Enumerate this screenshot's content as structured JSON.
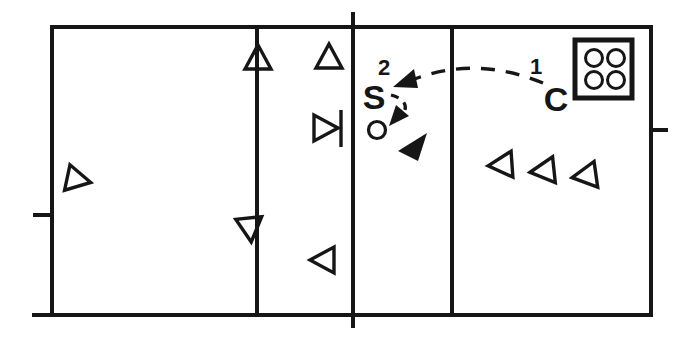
{
  "meta": {
    "background": "#ffffff",
    "ink": "#161616"
  },
  "labels": {
    "setter": "S",
    "coach": "C",
    "phase1": "1",
    "phase2": "2"
  },
  "court": {
    "outer": {
      "x": 52,
      "y": 27,
      "width": 599,
      "height": 288,
      "stroke_width": 4
    },
    "baseline_tail": {
      "name": "baseline-tail",
      "x1": 32,
      "y1": 315,
      "x2": 52,
      "y2": 315,
      "width": 4
    },
    "vertical_lines": [
      {
        "name": "left-attack-line",
        "x": 257,
        "y1": 27,
        "y2": 315,
        "width": 4
      },
      {
        "name": "center-net-line",
        "x": 353,
        "y1": 12,
        "y2": 328,
        "width": 4
      },
      {
        "name": "right-attack-line",
        "x": 452,
        "y1": 27,
        "y2": 315,
        "width": 4
      }
    ],
    "side_marks": [
      {
        "name": "left-side-mark",
        "x1": 33,
        "y1": 215,
        "x2": 52,
        "y2": 215,
        "width": 4
      },
      {
        "name": "right-side-mark",
        "x1": 651,
        "y1": 130,
        "x2": 668,
        "y2": 130,
        "width": 4
      }
    ]
  },
  "players_open": [
    {
      "name": "player-triangle-up-on-left-attack-line",
      "dir": "up",
      "x": 258,
      "y": 57,
      "rot": 0
    },
    {
      "name": "player-triangle-up-front-zone",
      "dir": "up",
      "x": 329,
      "y": 56,
      "rot": 0
    },
    {
      "name": "player-triangle-right-at-net",
      "dir": "right",
      "x": 326,
      "y": 128,
      "rot": 0,
      "bar": true
    },
    {
      "name": "player-triangle-right-left-court",
      "dir": "right",
      "x": 79,
      "y": 180,
      "rot": 12
    },
    {
      "name": "player-triangle-down-on-left-attack-line",
      "dir": "down",
      "x": 250,
      "y": 230,
      "rot": -6
    },
    {
      "name": "player-triangle-left-mid-court",
      "dir": "left",
      "x": 322,
      "y": 260,
      "rot": 0
    },
    {
      "name": "queue-player-triangle-1",
      "dir": "left",
      "x": 500,
      "y": 165,
      "rot": -4
    },
    {
      "name": "queue-player-triangle-2",
      "dir": "left",
      "x": 542,
      "y": 171,
      "rot": -6
    },
    {
      "name": "queue-player-triangle-3",
      "dir": "left",
      "x": 584,
      "y": 176,
      "rot": -8
    }
  ],
  "player_solid": {
    "name": "solid-player-triangle",
    "points": "398,151 427,133 418,161"
  },
  "ball": {
    "name": "ball-circle",
    "cx": 377,
    "cy": 130,
    "r": 8.5,
    "stroke_width": 3.2
  },
  "ball_cart": {
    "name": "ball-cart-box",
    "x": 575,
    "y": 40,
    "width": 57,
    "height": 58,
    "stroke_width": 5,
    "ball_r": 8.5,
    "ball_stroke": 3,
    "balls": [
      {
        "cx": 594,
        "cy": 58
      },
      {
        "cx": 616,
        "cy": 58
      },
      {
        "cx": 594,
        "cy": 80
      },
      {
        "cx": 616,
        "cy": 80
      }
    ]
  },
  "trajectories": [
    {
      "name": "toss-path-1",
      "d": "M 543,83 Q 473,54 407,82",
      "dash": "14 11",
      "width": 3.4,
      "arrow_name": "toss-arrowhead",
      "arrow": "393,87 414,69 418,88"
    },
    {
      "name": "set-path-2",
      "d": "M 391,95 C 403,98 409,105 403,115",
      "dash": "8 7",
      "width": 3.2,
      "arrow_name": "set-arrowhead",
      "arrow": "389,126 396,105 409,116"
    }
  ],
  "triangle_style": {
    "base": 26,
    "height": 24,
    "stroke_width": 3.4,
    "net_bar_dx": 15,
    "net_bar_up": 18,
    "net_bar_down": 19
  }
}
